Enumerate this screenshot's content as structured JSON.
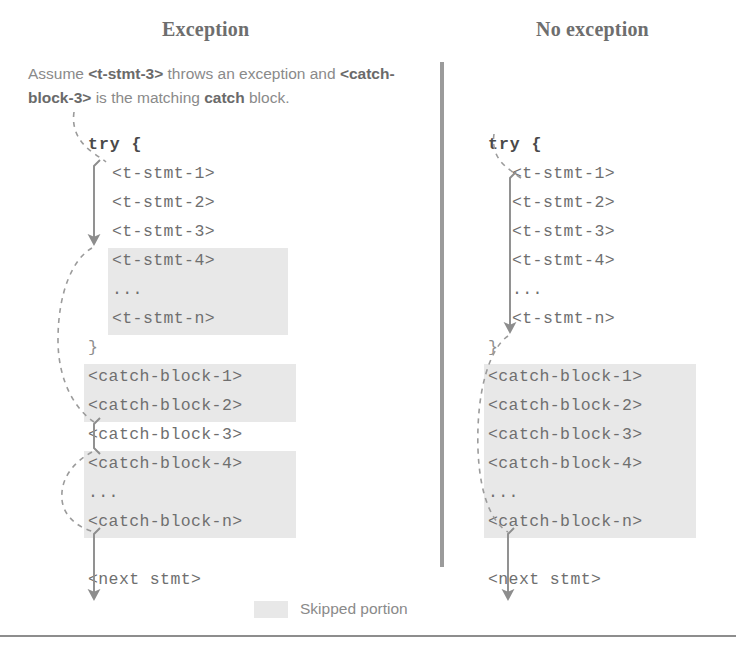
{
  "panels": [
    {
      "heading": "Exception",
      "caption_segments": [
        {
          "text": "Assume ",
          "bold": false
        },
        {
          "text": "<t-stmt-3>",
          "bold": true
        },
        {
          "text": " throws an exception and ",
          "bold": false
        },
        {
          "text": "<catch-block-3>",
          "bold": true
        },
        {
          "text": " is the matching ",
          "bold": false
        },
        {
          "text": "catch",
          "bold": true
        },
        {
          "text": " block.",
          "bold": false
        }
      ],
      "code_lines": [
        {
          "text": "try {",
          "style": "kw",
          "indent": false,
          "skipped": false
        },
        {
          "text": "<t-stmt-1>",
          "style": "plain",
          "indent": true,
          "skipped": false
        },
        {
          "text": "<t-stmt-2>",
          "style": "plain",
          "indent": true,
          "skipped": false
        },
        {
          "text": "<t-stmt-3>",
          "style": "plain",
          "indent": true,
          "skipped": false
        },
        {
          "text": "<t-stmt-4>",
          "style": "plain",
          "indent": true,
          "skipped": true
        },
        {
          "text": "...",
          "style": "plain",
          "indent": true,
          "skipped": true
        },
        {
          "text": "<t-stmt-n>",
          "style": "plain",
          "indent": true,
          "skipped": true
        },
        {
          "text": "}",
          "style": "brace",
          "indent": false,
          "skipped": false
        },
        {
          "text": "<catch-block-1>",
          "style": "plain",
          "indent": false,
          "skipped": true
        },
        {
          "text": "<catch-block-2>",
          "style": "plain",
          "indent": false,
          "skipped": true
        },
        {
          "text": "<catch-block-3>",
          "style": "plain",
          "indent": false,
          "skipped": false
        },
        {
          "text": "<catch-block-4>",
          "style": "plain",
          "indent": false,
          "skipped": true
        },
        {
          "text": "...",
          "style": "plain",
          "indent": false,
          "skipped": true
        },
        {
          "text": "<catch-block-n>",
          "style": "plain",
          "indent": false,
          "skipped": true
        },
        {
          "text": "",
          "style": "plain",
          "indent": false,
          "skipped": false
        },
        {
          "text": "<next stmt>",
          "style": "plain",
          "indent": false,
          "skipped": false
        }
      ]
    },
    {
      "heading": "No exception",
      "caption_segments": [],
      "code_lines": [
        {
          "text": "try {",
          "style": "kw",
          "indent": false,
          "skipped": false
        },
        {
          "text": "<t-stmt-1>",
          "style": "plain",
          "indent": true,
          "skipped": false
        },
        {
          "text": "<t-stmt-2>",
          "style": "plain",
          "indent": true,
          "skipped": false
        },
        {
          "text": "<t-stmt-3>",
          "style": "plain",
          "indent": true,
          "skipped": false
        },
        {
          "text": "<t-stmt-4>",
          "style": "plain",
          "indent": true,
          "skipped": false
        },
        {
          "text": "...",
          "style": "plain",
          "indent": true,
          "skipped": false
        },
        {
          "text": "<t-stmt-n>",
          "style": "plain",
          "indent": true,
          "skipped": false
        },
        {
          "text": "}",
          "style": "brace",
          "indent": false,
          "skipped": false
        },
        {
          "text": "<catch-block-1>",
          "style": "plain",
          "indent": false,
          "skipped": true
        },
        {
          "text": "<catch-block-2>",
          "style": "plain",
          "indent": false,
          "skipped": true
        },
        {
          "text": "<catch-block-3>",
          "style": "plain",
          "indent": false,
          "skipped": true
        },
        {
          "text": "<catch-block-4>",
          "style": "plain",
          "indent": false,
          "skipped": true
        },
        {
          "text": "...",
          "style": "plain",
          "indent": false,
          "skipped": true
        },
        {
          "text": "<catch-block-n>",
          "style": "plain",
          "indent": false,
          "skipped": true
        },
        {
          "text": "",
          "style": "plain",
          "indent": false,
          "skipped": false
        },
        {
          "text": "<next stmt>",
          "style": "plain",
          "indent": false,
          "skipped": false
        }
      ]
    }
  ],
  "legend": {
    "label": "Skipped portion",
    "swatch_color": "#e8e8e8"
  },
  "colors": {
    "code_text": "#6f6f6f",
    "heading": "#6e6e6e",
    "caption": "#8a8a8a",
    "arrow": "#8d8d8d",
    "divider": "#9b9b9b",
    "highlight": "#e8e8e8"
  }
}
